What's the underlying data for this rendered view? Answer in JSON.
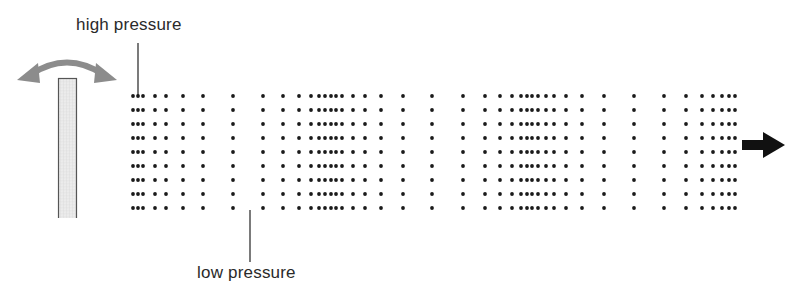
{
  "labels": {
    "high": "high pressure",
    "low": "low pressure"
  },
  "colors": {
    "dot": "#1a1a1a",
    "swing_arrow": "#8c8c8c",
    "plank_fill": "#e6e6e6",
    "plank_border": "#555555",
    "leader_line": "#222222",
    "direction_arrow": "#111111"
  },
  "particles": {
    "row_y": [
      96,
      110,
      124,
      138,
      152,
      166,
      180,
      194,
      208
    ],
    "column_x": [
      133,
      138,
      143,
      155,
      166,
      183,
      203,
      233,
      263,
      283,
      299,
      311,
      319,
      325,
      331,
      336,
      342,
      353,
      365,
      381,
      403,
      432,
      463,
      485,
      500,
      512,
      521,
      527,
      532,
      538,
      546,
      554,
      566,
      582,
      604,
      634,
      664,
      686,
      702,
      713,
      722,
      729,
      735
    ],
    "radius": 1.9
  },
  "source": {
    "plank": {
      "x": 58,
      "y": 78,
      "width": 19,
      "height": 140
    }
  },
  "leaders": {
    "high": {
      "x": 138,
      "y1": 43,
      "y2": 95
    },
    "low": {
      "x": 250,
      "y1": 210,
      "y2": 262
    }
  }
}
